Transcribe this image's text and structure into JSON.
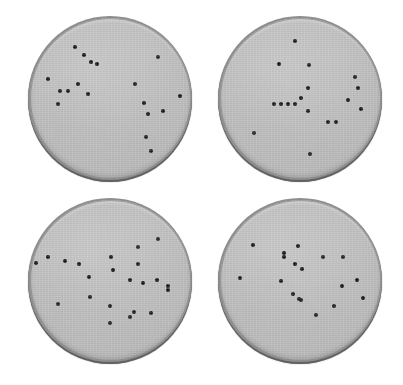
{
  "figure": {
    "background_color": "#ffffff",
    "width": 403,
    "height": 385
  },
  "style": {
    "agar_color": "#bdbdbd",
    "rim_color": "#8e8e8e",
    "rim_shadow_color": "#7d7d7d",
    "colony_color": "#151515",
    "colony_diameter_px": 4
  },
  "chart_data": {
    "type": "scatter",
    "xlabel": "",
    "ylabel": "",
    "grid": false,
    "legend": "none",
    "panel_layout": "2x2",
    "note": "Each panel is a circular petri dish; each point is one colony. Coordinates are normalized to the dish bounding box (0-1, origin top-left).",
    "panels": [
      {
        "id": "plate-top-left",
        "label": "",
        "position": {
          "left": 28,
          "top": 16,
          "diameter": 164
        },
        "colony_count": 18,
        "x": [
          0.285,
          0.337,
          0.38,
          0.42,
          0.118,
          0.797,
          0.303,
          0.24,
          0.366,
          0.177,
          0.658,
          0.713,
          0.936,
          0.734,
          0.829,
          0.726,
          0.755,
          0.19
        ],
        "y": [
          0.183,
          0.23,
          0.278,
          0.288,
          0.38,
          0.245,
          0.412,
          0.455,
          0.475,
          0.54,
          0.415,
          0.528,
          0.488,
          0.6,
          0.582,
          0.745,
          0.83,
          0.455
        ]
      },
      {
        "id": "plate-top-right",
        "label": "",
        "position": {
          "left": 218,
          "top": 16,
          "diameter": 164
        },
        "colony_count": 18,
        "x": [
          0.47,
          0.368,
          0.555,
          0.84,
          0.548,
          0.86,
          0.338,
          0.383,
          0.428,
          0.47,
          0.508,
          0.8,
          0.88,
          0.673,
          0.725,
          0.552,
          0.215,
          0.56
        ],
        "y": [
          0.145,
          0.288,
          0.296,
          0.372,
          0.44,
          0.44,
          0.54,
          0.54,
          0.54,
          0.538,
          0.5,
          0.51,
          0.57,
          0.648,
          0.648,
          0.578,
          0.72,
          0.845
        ]
      },
      {
        "id": "plate-bottom-left",
        "label": "",
        "position": {
          "left": 28,
          "top": 198,
          "diameter": 164
        },
        "colony_count": 22,
        "x": [
          0.8,
          0.672,
          0.118,
          0.218,
          0.043,
          0.31,
          0.505,
          0.672,
          0.518,
          0.37,
          0.625,
          0.705,
          0.79,
          0.862,
          0.862,
          0.378,
          0.175,
          0.5,
          0.648,
          0.625,
          0.755,
          0.5
        ],
        "y": [
          0.245,
          0.295,
          0.355,
          0.38,
          0.395,
          0.4,
          0.358,
          0.4,
          0.435,
          0.48,
          0.5,
          0.518,
          0.498,
          0.535,
          0.56,
          0.605,
          0.65,
          0.66,
          0.7,
          0.73,
          0.702,
          0.768
        ]
      },
      {
        "id": "plate-bottom-right",
        "label": "",
        "position": {
          "left": 218,
          "top": 198,
          "diameter": 164
        },
        "colony_count": 18,
        "x": [
          0.205,
          0.402,
          0.49,
          0.4,
          0.64,
          0.77,
          0.468,
          0.51,
          0.13,
          0.382,
          0.855,
          0.76,
          0.455,
          0.495,
          0.505,
          0.71,
          0.6,
          0.89
        ],
        "y": [
          0.285,
          0.33,
          0.288,
          0.36,
          0.36,
          0.358,
          0.398,
          0.432,
          0.49,
          0.505,
          0.5,
          0.535,
          0.59,
          0.62,
          0.625,
          0.66,
          0.715,
          0.612
        ]
      }
    ]
  }
}
